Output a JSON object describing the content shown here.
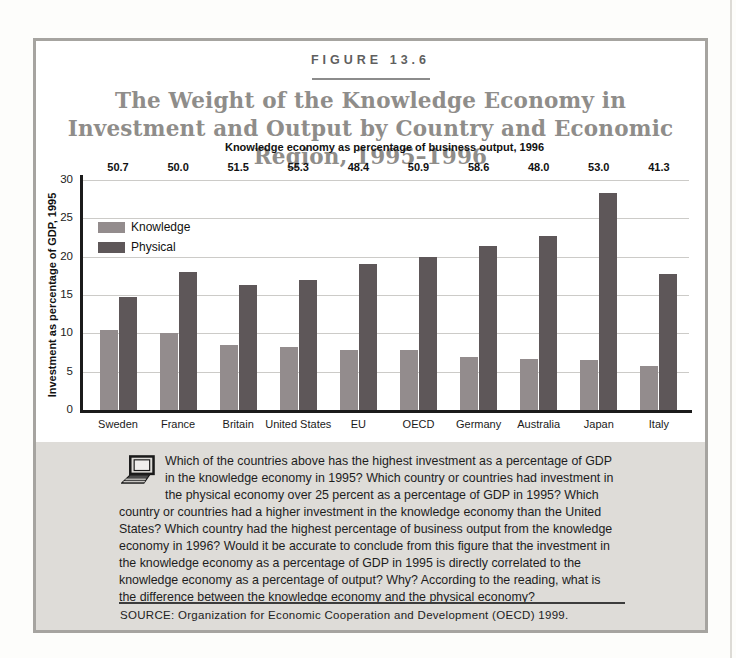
{
  "figure": {
    "label": "FIGURE 13.6",
    "title": "The Weight of the Knowledge Economy in Investment and Output by Country and Economic Region, 1995–1996"
  },
  "chart_data": {
    "type": "bar",
    "top_axis_title": "Knowledge economy as percentage of business output, 1996",
    "ylabel": "Investment as percentage of GDP, 1995",
    "ylim": [
      0,
      30
    ],
    "ytick_step": 5,
    "grid": true,
    "legend_position": "upper-left",
    "categories": [
      "Sweden",
      "France",
      "Britain",
      "United States",
      "EU",
      "OECD",
      "Germany",
      "Australia",
      "Japan",
      "Italy"
    ],
    "top_values": [
      "50.7",
      "50.0",
      "51.5",
      "55.3",
      "48.4",
      "50.9",
      "58.6",
      "48.0",
      "53.0",
      "41.3"
    ],
    "series": [
      {
        "name": "Knowledge",
        "color": "#938c8d",
        "values": [
          10.4,
          10.1,
          8.5,
          8.2,
          7.8,
          7.8,
          6.9,
          6.6,
          6.5,
          5.8
        ]
      },
      {
        "name": "Physical",
        "color": "#5e5759",
        "values": [
          14.8,
          18.0,
          16.3,
          16.9,
          19.0,
          19.9,
          21.4,
          22.7,
          28.3,
          17.7
        ]
      }
    ],
    "colors": {
      "gridline": "#cccbc8",
      "axis": "#1b1b1b"
    }
  },
  "questions": {
    "icon": "computer-icon",
    "text": "Which of the countries above has the highest investment as a percentage of GDP in the knowledge economy in 1995? Which country or countries had investment in the physical economy over 25 percent as a percentage of GDP in 1995? Which country or countries had a higher investment in the knowledge economy than the United States? Which country had the highest percentage of business output from the knowledge economy in 1996? Would it be accurate to conclude from this figure that the investment in the knowledge economy as a percentage of GDP in 1995 is directly correlated to the knowledge economy as a percentage of output? Why? According to the reading, what is the difference between the knowledge economy and the physical economy?"
  },
  "source": {
    "text": "SOURCE: Organization for Economic Cooperation and Development (OECD) 1999."
  }
}
